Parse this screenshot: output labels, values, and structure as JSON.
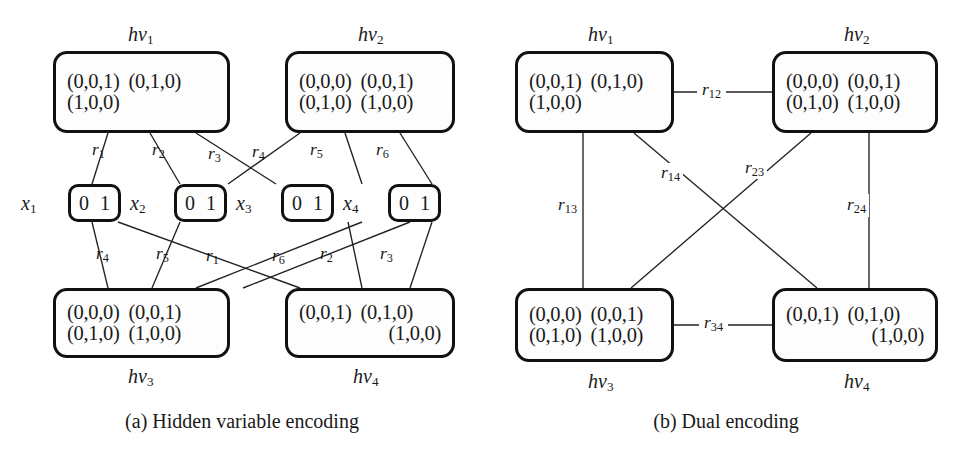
{
  "figure": {
    "panels": [
      {
        "id": "a",
        "caption": "(a) Hidden variable encoding",
        "hv_nodes": [
          {
            "name": "hv1",
            "label": "hv",
            "sub": "1",
            "label_pos": "top",
            "rows": [
              {
                "align": "left",
                "cells": [
                  "(0,0,1)",
                  "(0,1,0)"
                ]
              },
              {
                "align": "left",
                "cells": [
                  "(1,0,0)"
                ]
              }
            ]
          },
          {
            "name": "hv2",
            "label": "hv",
            "sub": "2",
            "label_pos": "top",
            "rows": [
              {
                "align": "left",
                "cells": [
                  "(0,0,0)",
                  "(0,0,1)"
                ]
              },
              {
                "align": "left",
                "cells": [
                  "(0,1,0)",
                  "(1,0,0)"
                ]
              }
            ]
          },
          {
            "name": "hv3",
            "label": "hv",
            "sub": "3",
            "label_pos": "bottom",
            "rows": [
              {
                "align": "left",
                "cells": [
                  "(0,0,0)",
                  "(0,0,1)"
                ]
              },
              {
                "align": "left",
                "cells": [
                  "(0,1,0)",
                  "(1,0,0)"
                ]
              }
            ]
          },
          {
            "name": "hv4",
            "label": "hv",
            "sub": "4",
            "label_pos": "bottom",
            "rows": [
              {
                "align": "left",
                "cells": [
                  "(0,0,1)",
                  "(0,1,0)"
                ]
              },
              {
                "align": "right",
                "cells": [
                  "(1,0,0)"
                ]
              }
            ]
          }
        ],
        "x_nodes": [
          {
            "name": "x1",
            "label": "x",
            "sub": "1",
            "domain": "0 1"
          },
          {
            "name": "x2",
            "label": "x",
            "sub": "2",
            "domain": "0 1"
          },
          {
            "name": "x3",
            "label": "x",
            "sub": "3",
            "domain": "0 1"
          },
          {
            "name": "x4",
            "label": "x",
            "sub": "4",
            "domain": "0 1"
          }
        ],
        "edge_labels": [
          {
            "label": "r",
            "sub": "1"
          },
          {
            "label": "r",
            "sub": "2"
          },
          {
            "label": "r",
            "sub": "3"
          },
          {
            "label": "r",
            "sub": "4"
          },
          {
            "label": "r",
            "sub": "5"
          },
          {
            "label": "r",
            "sub": "6"
          },
          {
            "label": "r",
            "sub": "4"
          },
          {
            "label": "r",
            "sub": "5"
          },
          {
            "label": "r",
            "sub": "1"
          },
          {
            "label": "r",
            "sub": "6"
          },
          {
            "label": "r",
            "sub": "2"
          },
          {
            "label": "r",
            "sub": "3"
          }
        ]
      },
      {
        "id": "b",
        "caption": "(b) Dual encoding",
        "hv_nodes": [
          {
            "name": "hv1",
            "label": "hv",
            "sub": "1",
            "label_pos": "top",
            "rows": [
              {
                "align": "left",
                "cells": [
                  "(0,0,1)",
                  "(0,1,0)"
                ]
              },
              {
                "align": "left",
                "cells": [
                  "(1,0,0)"
                ]
              }
            ]
          },
          {
            "name": "hv2",
            "label": "hv",
            "sub": "2",
            "label_pos": "top",
            "rows": [
              {
                "align": "left",
                "cells": [
                  "(0,0,0)",
                  "(0,0,1)"
                ]
              },
              {
                "align": "left",
                "cells": [
                  "(0,1,0)",
                  "(1,0,0)"
                ]
              }
            ]
          },
          {
            "name": "hv3",
            "label": "hv",
            "sub": "3",
            "label_pos": "bottom",
            "rows": [
              {
                "align": "left",
                "cells": [
                  "(0,0,0)",
                  "(0,0,1)"
                ]
              },
              {
                "align": "left",
                "cells": [
                  "(0,1,0)",
                  "(1,0,0)"
                ]
              }
            ]
          },
          {
            "name": "hv4",
            "label": "hv",
            "sub": "4",
            "label_pos": "bottom",
            "rows": [
              {
                "align": "left",
                "cells": [
                  "(0,0,1)",
                  "(0,1,0)"
                ]
              },
              {
                "align": "right",
                "cells": [
                  "(1,0,0)"
                ]
              }
            ]
          }
        ],
        "edge_labels": [
          {
            "label": "r",
            "sub": "12"
          },
          {
            "label": "r",
            "sub": "13"
          },
          {
            "label": "r",
            "sub": "14"
          },
          {
            "label": "r",
            "sub": "23"
          },
          {
            "label": "r",
            "sub": "24"
          },
          {
            "label": "r",
            "sub": "34"
          }
        ]
      }
    ]
  },
  "colors": {
    "ink": "#111111",
    "edge": "#222222",
    "paper": "#ffffff"
  }
}
